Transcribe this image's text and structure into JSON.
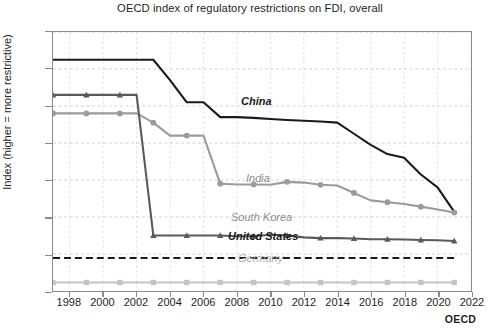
{
  "chart_data": {
    "type": "line",
    "title": "OECD index of regulatory restrictions on FDI, overall",
    "xlabel": "",
    "ylabel": "Index (higher = more restrictive)",
    "source": "OECD",
    "xlim": [
      1997,
      2022
    ],
    "ylim": [
      0.0,
      0.7
    ],
    "grid": true,
    "legend_position": "inline-labels",
    "ytick_labels": [
      "0.0",
      "0.1",
      "0.2",
      "0.3",
      "0.4",
      "0.5",
      "0.6",
      "0.7"
    ],
    "ytick_values": [
      0.0,
      0.1,
      0.2,
      0.3,
      0.4,
      0.5,
      0.6,
      0.7
    ],
    "xtick_labels": [
      "1998",
      "2000",
      "2002",
      "2004",
      "2006",
      "2008",
      "2010",
      "2012",
      "2014",
      "2016",
      "2018",
      "2020",
      "2022"
    ],
    "xtick_values": [
      1998,
      2000,
      2002,
      2004,
      2006,
      2008,
      2010,
      2012,
      2014,
      2016,
      2018,
      2020,
      2022
    ],
    "x": [
      1997,
      1998,
      1999,
      2000,
      2001,
      2002,
      2003,
      2004,
      2005,
      2006,
      2007,
      2008,
      2009,
      2010,
      2011,
      2012,
      2013,
      2014,
      2015,
      2016,
      2017,
      2018,
      2019,
      2020,
      2021
    ],
    "series": [
      {
        "name": "China",
        "color": "#1a1a1a",
        "marker": "none",
        "style": "solid",
        "values": [
          0.625,
          0.625,
          0.625,
          0.625,
          0.625,
          0.625,
          0.625,
          0.57,
          0.51,
          0.51,
          0.47,
          0.47,
          0.468,
          0.465,
          0.462,
          0.46,
          0.458,
          0.455,
          0.425,
          0.395,
          0.37,
          0.36,
          0.315,
          0.28,
          0.214
        ]
      },
      {
        "name": "India",
        "color": "#9b9b9b",
        "marker": "circle",
        "style": "solid",
        "values": [
          0.48,
          0.48,
          0.48,
          0.48,
          0.48,
          0.48,
          0.455,
          0.42,
          0.42,
          0.42,
          0.29,
          0.288,
          0.288,
          0.287,
          0.295,
          0.293,
          0.287,
          0.285,
          0.265,
          0.245,
          0.24,
          0.235,
          0.228,
          0.22,
          0.212
        ]
      },
      {
        "name": "South Korea",
        "color": "#595959",
        "marker": "triangle",
        "style": "solid",
        "values": [
          0.53,
          0.53,
          0.53,
          0.53,
          0.53,
          0.53,
          0.15,
          0.15,
          0.15,
          0.15,
          0.15,
          0.148,
          0.148,
          0.152,
          0.15,
          0.145,
          0.143,
          0.143,
          0.142,
          0.14,
          0.14,
          0.139,
          0.138,
          0.137,
          0.135
        ]
      },
      {
        "name": "United States",
        "color": "#1a1a1a",
        "marker": "none",
        "style": "dashed",
        "values": [
          0.089,
          0.089,
          0.089,
          0.089,
          0.089,
          0.089,
          0.089,
          0.089,
          0.089,
          0.089,
          0.089,
          0.089,
          0.089,
          0.089,
          0.089,
          0.089,
          0.089,
          0.089,
          0.089,
          0.089,
          0.089,
          0.089,
          0.089,
          0.089,
          0.089
        ]
      },
      {
        "name": "Germany",
        "color": "#c4c4c4",
        "marker": "square",
        "style": "solid",
        "values": [
          0.023,
          0.023,
          0.023,
          0.023,
          0.023,
          0.023,
          0.023,
          0.023,
          0.023,
          0.023,
          0.023,
          0.023,
          0.023,
          0.023,
          0.023,
          0.023,
          0.023,
          0.023,
          0.023,
          0.023,
          0.023,
          0.023,
          0.023,
          0.023,
          0.023
        ]
      }
    ],
    "inline_labels": [
      {
        "name": "China",
        "text": "China"
      },
      {
        "name": "India",
        "text": "India"
      },
      {
        "name": "South Korea",
        "text": "South Korea"
      },
      {
        "name": "United States",
        "text": "United States"
      },
      {
        "name": "Germany",
        "text": "Germany"
      }
    ]
  }
}
